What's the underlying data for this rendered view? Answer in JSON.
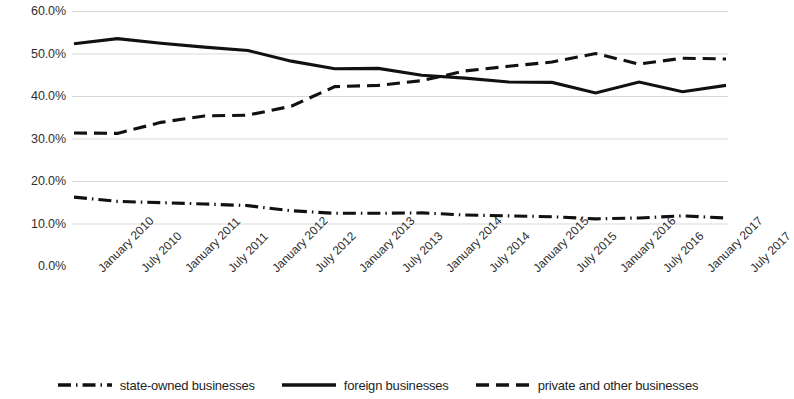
{
  "chart_data": {
    "type": "line",
    "title": "",
    "xlabel": "",
    "ylabel": "",
    "ylim": [
      0,
      60
    ],
    "ytick_labels": [
      "60.0%",
      "50.0%",
      "40.0%",
      "30.0%",
      "20.0%",
      "10.0%",
      "0.0%"
    ],
    "ytick_values": [
      60,
      50,
      40,
      30,
      20,
      10,
      0
    ],
    "grid": true,
    "legend_position": "bottom",
    "categories": [
      "January 2010",
      "July 2010",
      "January 2011",
      "July 2011",
      "January 2012",
      "July 2012",
      "January 2013",
      "July 2013",
      "January 2014",
      "July 2014",
      "January 2015",
      "July 2015",
      "January 2016",
      "July 2016",
      "January 2017",
      "July 2017"
    ],
    "series": [
      {
        "name": "state-owned businesses",
        "style": "dash-dot",
        "color": "#111111",
        "values": [
          16.2,
          15.2,
          14.9,
          14.6,
          14.2,
          13.0,
          12.4,
          12.4,
          12.5,
          12.0,
          11.8,
          11.6,
          11.1,
          11.3,
          11.8,
          11.3
        ]
      },
      {
        "name": "foreign businesses",
        "style": "solid",
        "color": "#111111",
        "values": [
          52.3,
          53.5,
          52.4,
          51.5,
          50.7,
          48.2,
          46.4,
          46.5,
          44.9,
          44.2,
          43.3,
          43.2,
          40.7,
          43.3,
          41.0,
          42.5
        ]
      },
      {
        "name": "private and other businesses",
        "style": "dashed",
        "color": "#111111",
        "values": [
          31.3,
          31.2,
          33.8,
          35.3,
          35.5,
          37.6,
          42.2,
          42.5,
          43.6,
          45.9,
          47.0,
          48.0,
          50.0,
          47.5,
          48.9,
          48.7
        ]
      }
    ]
  },
  "legend": {
    "items": [
      {
        "label": "state-owned businesses",
        "marker": "dash-dot-line-icon"
      },
      {
        "label": "foreign businesses",
        "marker": "solid-line-icon"
      },
      {
        "label": "private and other businesses",
        "marker": "dashed-line-icon"
      }
    ]
  }
}
